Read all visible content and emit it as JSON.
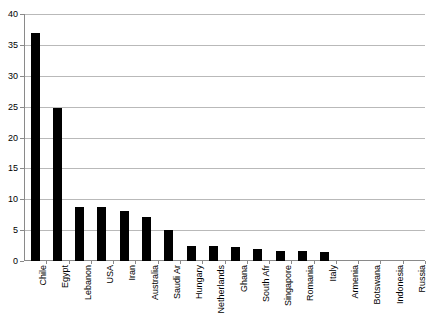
{
  "chart_data": {
    "type": "bar",
    "title": "",
    "subtitle": "",
    "xlabel": "",
    "ylabel": "",
    "ylim": [
      0,
      40
    ],
    "grid": true,
    "grid_axis": "y",
    "legend": false,
    "legend_position": "none",
    "bar_color": "#000000",
    "categories": [
      "Chile",
      "Egypt",
      "Lebanon",
      "USA",
      "Iran",
      "Australia",
      "Saudi Ar",
      "Hungary",
      "Netherlands",
      "Ghana",
      "South Afr",
      "Singapore",
      "Romania",
      "Italy",
      "Armenia",
      "Botswana",
      "Indonesia",
      "Russia"
    ],
    "values": [
      37.0,
      24.7,
      8.7,
      8.7,
      8.1,
      7.1,
      5.0,
      2.5,
      2.5,
      2.2,
      2.0,
      1.6,
      1.6,
      1.5,
      0.0,
      0.0,
      0.0,
      0.0
    ],
    "y_ticks": [
      0,
      5,
      10,
      15,
      20,
      25,
      30,
      35,
      40
    ],
    "y_tick_labels": [
      "0",
      "5",
      "10",
      "15",
      "20",
      "25",
      "30",
      "35",
      "40"
    ],
    "annotations": []
  }
}
